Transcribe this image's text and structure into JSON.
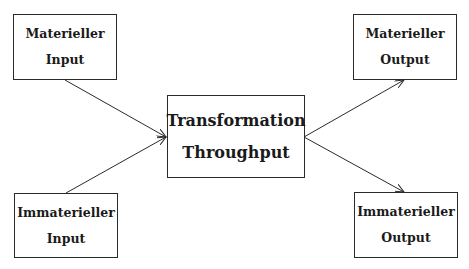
{
  "diagram": {
    "nodes": {
      "material_input": {
        "line1": "Materieller",
        "line2": "Input"
      },
      "immaterial_input": {
        "line1": "Immaterieller",
        "line2": "Input"
      },
      "transformation": {
        "line1": "Transformation",
        "line2": "Throughput"
      },
      "material_output": {
        "line1": "Materieller",
        "line2": "Output"
      },
      "immaterial_output": {
        "line1": "Immaterieller",
        "line2": "Output"
      }
    },
    "edges": [
      {
        "from": "material_input",
        "to": "transformation"
      },
      {
        "from": "immaterial_input",
        "to": "transformation"
      },
      {
        "from": "transformation",
        "to": "material_output"
      },
      {
        "from": "transformation",
        "to": "immaterial_output"
      }
    ],
    "colors": {
      "stroke": "#2a2a2a",
      "text": "#1a1a1a",
      "background": "#ffffff"
    }
  }
}
